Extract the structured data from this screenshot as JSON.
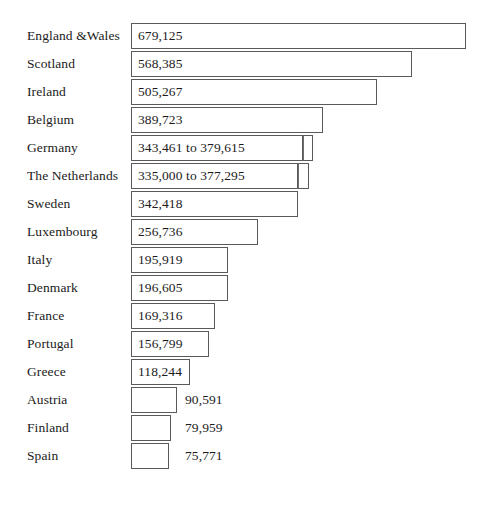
{
  "chart_data": {
    "type": "bar",
    "orientation": "horizontal",
    "title": "",
    "subtitle": "",
    "xlabel": "",
    "ylabel": "",
    "grid": false,
    "legend": null,
    "axis_visible": false,
    "value_label_position": "inside-bar for top 13 rows, right-of-bar for bottom 3 rows",
    "xlim": [
      0,
      679125
    ],
    "categories": [
      "England &Wales",
      "Scotland",
      "Ireland",
      "Belgium",
      "Germany",
      "The Netherlands",
      "Sweden",
      "Luxembourg",
      "Italy",
      "Denmark",
      "France",
      "Portugal",
      "Greece",
      "Austria",
      "Finland",
      "Spain"
    ],
    "values": [
      679125,
      568385,
      505267,
      389723,
      343461,
      335000,
      342418,
      256736,
      195919,
      196605,
      169316,
      156799,
      118244,
      90591,
      79959,
      75771
    ],
    "value_labels": [
      "679,125",
      "568,385",
      "505,267",
      "389,723",
      "343,461 to 379,615",
      "335,000 to 377,295",
      "342,418",
      "256,736",
      "195,919",
      "196,605",
      "169,316",
      "156,799",
      "118,244",
      "90,591",
      "79,959",
      "75,771"
    ],
    "ranges": {
      "Germany": {
        "min": 343461,
        "max": 379615
      },
      "The Netherlands": {
        "min": 335000,
        "max": 377295
      }
    }
  },
  "rows": [
    {
      "label": "England &Wales",
      "value_label": "679,125",
      "value": 679125,
      "bar_px": 335,
      "ext_px": 0,
      "label_inside": true,
      "value_left_px": 0
    },
    {
      "label": "Scotland",
      "value_label": "568,385",
      "value": 568385,
      "bar_px": 281,
      "ext_px": 0,
      "label_inside": true,
      "value_left_px": 0
    },
    {
      "label": "Ireland",
      "value_label": "505,267",
      "value": 505267,
      "bar_px": 246,
      "ext_px": 0,
      "label_inside": true,
      "value_left_px": 0
    },
    {
      "label": "Belgium",
      "value_label": "389,723",
      "value": 389723,
      "bar_px": 192,
      "ext_px": 0,
      "label_inside": true,
      "value_left_px": 0
    },
    {
      "label": "Germany",
      "value_label": "343,461 to 379,615",
      "value": 343461,
      "bar_px": 172,
      "ext_px": 10,
      "label_inside": true,
      "value_left_px": 0
    },
    {
      "label": "The Netherlands",
      "value_label": "335,000 to 377,295",
      "value": 335000,
      "bar_px": 167,
      "ext_px": 11,
      "label_inside": true,
      "value_left_px": 0
    },
    {
      "label": "Sweden",
      "value_label": "342,418",
      "value": 342418,
      "bar_px": 167,
      "ext_px": 0,
      "label_inside": true,
      "value_left_px": 0
    },
    {
      "label": "Luxembourg",
      "value_label": "256,736",
      "value": 256736,
      "bar_px": 127,
      "ext_px": 0,
      "label_inside": true,
      "value_left_px": 0
    },
    {
      "label": "Italy",
      "value_label": "195,919",
      "value": 195919,
      "bar_px": 97,
      "ext_px": 0,
      "label_inside": true,
      "value_left_px": 0
    },
    {
      "label": "Denmark",
      "value_label": "196,605",
      "value": 196605,
      "bar_px": 97,
      "ext_px": 0,
      "label_inside": true,
      "value_left_px": 0
    },
    {
      "label": "France",
      "value_label": "169,316",
      "value": 169316,
      "bar_px": 84,
      "ext_px": 0,
      "label_inside": true,
      "value_left_px": 0
    },
    {
      "label": "Portugal",
      "value_label": "156,799",
      "value": 156799,
      "bar_px": 78,
      "ext_px": 0,
      "label_inside": true,
      "value_left_px": 0
    },
    {
      "label": "Greece",
      "value_label": "118,244",
      "value": 118244,
      "bar_px": 59,
      "ext_px": 0,
      "label_inside": true,
      "value_left_px": 0
    },
    {
      "label": "Austria",
      "value_label": "90,591",
      "value": 90591,
      "bar_px": 46,
      "ext_px": 0,
      "label_inside": false,
      "value_left_px": 185
    },
    {
      "label": "Finland",
      "value_label": "79,959",
      "value": 79959,
      "bar_px": 40,
      "ext_px": 0,
      "label_inside": false,
      "value_left_px": 185
    },
    {
      "label": "Spain",
      "value_label": "75,771",
      "value": 75771,
      "bar_px": 38,
      "ext_px": 0,
      "label_inside": false,
      "value_left_px": 185
    }
  ],
  "layout": {
    "bar_origin_x": 131,
    "row_height": 28,
    "first_row_top": 22,
    "label_x": 27,
    "value_inside_offset": 7
  },
  "colors": {
    "background": "#ffffff",
    "bar_fill": "#ffffff",
    "bar_stroke": "#5a5a5a",
    "text": "#1b1b1b"
  }
}
